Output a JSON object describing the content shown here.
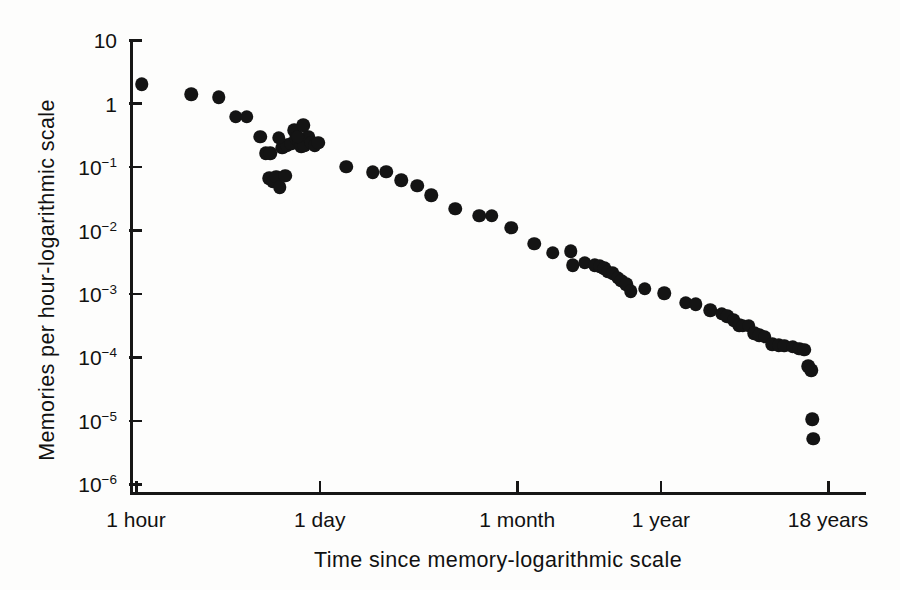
{
  "chart_data": {
    "type": "scatter",
    "title": "",
    "xlabel": "Time since memory-logarithmic scale",
    "ylabel": "Memories per hour-logarithmic scale",
    "xscale": "log",
    "yscale": "log",
    "grid": false,
    "legend": null,
    "xtick_labels": [
      "1 hour",
      "1 day",
      "1 month",
      "1 year",
      "18 years"
    ],
    "xtick_hours": [
      1,
      24,
      730,
      8760,
      157680
    ],
    "ytick_labels": [
      "10",
      "1",
      "10-1",
      "10-2",
      "10-3",
      "10-4",
      "10-5",
      "10-6"
    ],
    "ytick_values": [
      10,
      1,
      0.1,
      0.01,
      0.001,
      0.0001,
      1e-05,
      1e-06
    ],
    "ylim": [
      1e-06,
      10
    ],
    "marker": "filled-circle",
    "marker_color": "#141414",
    "point_count": 75,
    "points": [
      {
        "x": 1.1,
        "y": 2.0
      },
      {
        "x": 2.6,
        "y": 1.4
      },
      {
        "x": 4.2,
        "y": 1.25
      },
      {
        "x": 5.6,
        "y": 0.62
      },
      {
        "x": 6.8,
        "y": 0.62
      },
      {
        "x": 8.6,
        "y": 0.3
      },
      {
        "x": 9.4,
        "y": 0.165
      },
      {
        "x": 10.0,
        "y": 0.066
      },
      {
        "x": 10.6,
        "y": 0.058
      },
      {
        "x": 11.3,
        "y": 0.07
      },
      {
        "x": 12.0,
        "y": 0.048
      },
      {
        "x": 13.2,
        "y": 0.072
      },
      {
        "x": 12.6,
        "y": 0.2
      },
      {
        "x": 13.6,
        "y": 0.22
      },
      {
        "x": 14.6,
        "y": 0.23
      },
      {
        "x": 15.4,
        "y": 0.38
      },
      {
        "x": 16.0,
        "y": 0.28
      },
      {
        "x": 16.8,
        "y": 0.25
      },
      {
        "x": 17.4,
        "y": 0.21
      },
      {
        "x": 18.4,
        "y": 0.22
      },
      {
        "x": 19.6,
        "y": 0.3
      },
      {
        "x": 20.8,
        "y": 0.24
      },
      {
        "x": 22.0,
        "y": 0.22
      },
      {
        "x": 23.4,
        "y": 0.24
      },
      {
        "x": 16.4,
        "y": 0.3
      },
      {
        "x": 18.0,
        "y": 0.45
      },
      {
        "x": 11.8,
        "y": 0.29
      },
      {
        "x": 10.2,
        "y": 0.165
      },
      {
        "x": 38.0,
        "y": 0.1
      },
      {
        "x": 60.0,
        "y": 0.082
      },
      {
        "x": 76.0,
        "y": 0.084
      },
      {
        "x": 98.0,
        "y": 0.062
      },
      {
        "x": 130.0,
        "y": 0.05
      },
      {
        "x": 165.0,
        "y": 0.036
      },
      {
        "x": 250.0,
        "y": 0.022
      },
      {
        "x": 380.0,
        "y": 0.017
      },
      {
        "x": 470.0,
        "y": 0.017
      },
      {
        "x": 660.0,
        "y": 0.011
      },
      {
        "x": 980.0,
        "y": 0.0061
      },
      {
        "x": 1350.0,
        "y": 0.0044
      },
      {
        "x": 1850.0,
        "y": 0.0047
      },
      {
        "x": 1900.0,
        "y": 0.0028
      },
      {
        "x": 2350.0,
        "y": 0.0031
      },
      {
        "x": 2800.0,
        "y": 0.0028
      },
      {
        "x": 3050.0,
        "y": 0.0027
      },
      {
        "x": 3300.0,
        "y": 0.0025
      },
      {
        "x": 3500.0,
        "y": 0.0022
      },
      {
        "x": 3800.0,
        "y": 0.0021
      },
      {
        "x": 4150.0,
        "y": 0.0018
      },
      {
        "x": 4400.0,
        "y": 0.0016
      },
      {
        "x": 4800.0,
        "y": 0.0014
      },
      {
        "x": 5200.0,
        "y": 0.0011
      },
      {
        "x": 6600.0,
        "y": 0.0012
      },
      {
        "x": 9300.0,
        "y": 0.00102
      },
      {
        "x": 13500.0,
        "y": 0.00072
      },
      {
        "x": 16000.0,
        "y": 0.00068
      },
      {
        "x": 20500.0,
        "y": 0.00055
      },
      {
        "x": 25000.0,
        "y": 0.00048
      },
      {
        "x": 27500.0,
        "y": 0.00044
      },
      {
        "x": 31000.0,
        "y": 0.00038
      },
      {
        "x": 34000.0,
        "y": 0.00032
      },
      {
        "x": 36000.0,
        "y": 0.00031
      },
      {
        "x": 40000.0,
        "y": 0.00031
      },
      {
        "x": 44000.0,
        "y": 0.00024
      },
      {
        "x": 48000.0,
        "y": 0.00022
      },
      {
        "x": 53000.0,
        "y": 0.00021
      },
      {
        "x": 60000.0,
        "y": 0.00016
      },
      {
        "x": 67000.0,
        "y": 0.000155
      },
      {
        "x": 74000.0,
        "y": 0.00015
      },
      {
        "x": 86000.0,
        "y": 0.000145
      },
      {
        "x": 96000.0,
        "y": 0.000135
      },
      {
        "x": 105000.0,
        "y": 0.00013
      },
      {
        "x": 112000.0,
        "y": 7.2e-05
      },
      {
        "x": 118000.0,
        "y": 6.2e-05
      },
      {
        "x": 120000.0,
        "y": 1.05e-05
      },
      {
        "x": 122000.0,
        "y": 5.2e-06
      }
    ]
  }
}
